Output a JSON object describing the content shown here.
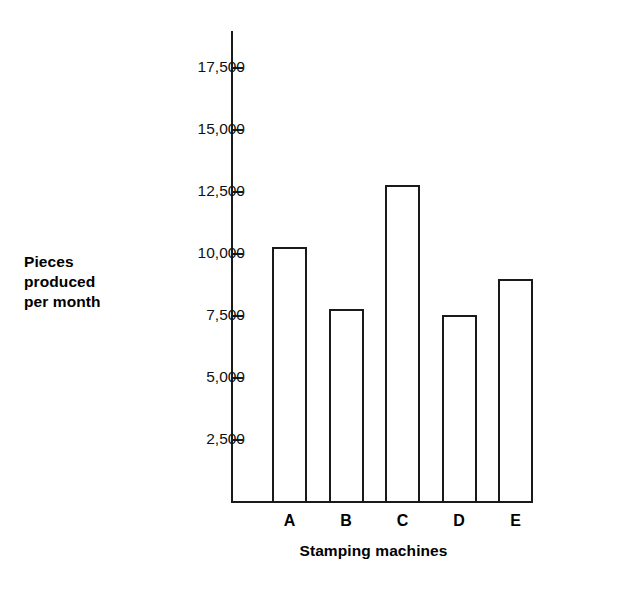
{
  "chart_data": {
    "type": "bar",
    "title": "",
    "xlabel": "Stamping machines",
    "ylabel": "Pieces\nproduced\nper month",
    "categories": [
      "A",
      "B",
      "C",
      "D",
      "E"
    ],
    "values": [
      10300,
      7800,
      12800,
      7550,
      9000
    ],
    "ylim": [
      0,
      18500
    ],
    "ytick_values": [
      2500,
      5000,
      7500,
      10000,
      12500,
      15000,
      17500
    ],
    "ytick_labels": [
      "2,500",
      "5,000",
      "7,500",
      "10,000",
      "12,500",
      "15,000",
      "17,500"
    ],
    "grid": false,
    "legend": null,
    "bar_style": {
      "fill": "#ffffff",
      "edge": "#1a1a1a",
      "edge_width": 2
    },
    "axis_color": "#1a1a1a",
    "background": "#ffffff"
  }
}
